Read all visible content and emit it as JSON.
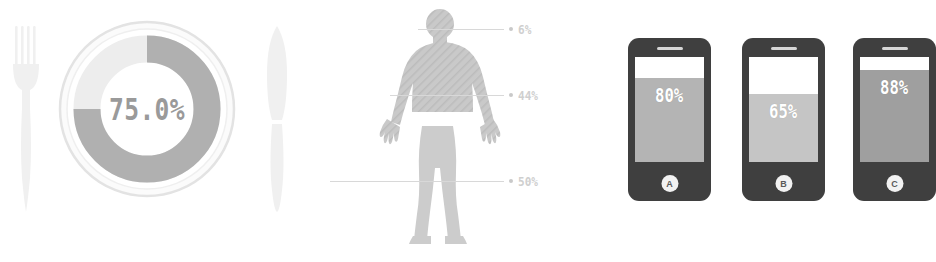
{
  "infographic": {
    "panels": [
      {
        "id": "plate-donut",
        "title": "Plate donut gauge"
      },
      {
        "id": "body-breakdown",
        "title": "Body distribution"
      },
      {
        "id": "phone-bars",
        "title": "Device fill levels"
      }
    ]
  },
  "donut": {
    "value_label": "75.0%",
    "track_color": "#ededed",
    "arc_color": "#b0b0b0",
    "plate_rim_color": "#e3e3e3",
    "text_color": "#9a9a9a",
    "fork_icon": "fork-icon",
    "knife_icon": "knife-icon"
  },
  "body": {
    "silhouette_color": "#cfcfcf",
    "silhouette_shade_color": "#bdbdbd",
    "callouts": [
      {
        "id": "head",
        "label": "6%"
      },
      {
        "id": "torso",
        "label": "44%"
      },
      {
        "id": "legs",
        "label": "50%"
      }
    ]
  },
  "phones": {
    "body_color": "#3f3f3f",
    "items": [
      {
        "id": "a",
        "percent_label": "80%",
        "fill_percent": 80,
        "fill_color": "#b4b4b4",
        "button_label": "A"
      },
      {
        "id": "b",
        "percent_label": "65%",
        "fill_percent": 65,
        "fill_color": "#c5c5c5",
        "button_label": "B"
      },
      {
        "id": "c",
        "percent_label": "88%",
        "fill_percent": 88,
        "fill_color": "#9f9f9f",
        "button_label": "C"
      }
    ]
  },
  "chart_data": [
    {
      "type": "pie",
      "title": "Plate donut gauge",
      "categories": [
        "Filled",
        "Remaining"
      ],
      "values": [
        75.0,
        25.0
      ],
      "unit": "%",
      "annotations": [
        "75.0%"
      ],
      "legend": "none",
      "notes": "Donut arc starts at 12 o'clock and sweeps 270 degrees clockwise"
    },
    {
      "type": "bar",
      "title": "Body distribution",
      "categories": [
        "Head",
        "Torso",
        "Legs"
      ],
      "values": [
        6,
        44,
        50
      ],
      "unit": "%",
      "xlabel": "",
      "ylabel": "",
      "ylim": [
        0,
        100
      ],
      "grid": false,
      "legend": "none",
      "annotations": [
        "6%",
        "44%",
        "50%"
      ]
    },
    {
      "type": "bar",
      "title": "Device fill levels",
      "categories": [
        "A",
        "B",
        "C"
      ],
      "values": [
        80,
        65,
        88
      ],
      "unit": "%",
      "xlabel": "",
      "ylabel": "",
      "ylim": [
        0,
        100
      ],
      "grid": false,
      "legend": "none",
      "annotations": [
        "80%",
        "65%",
        "88%"
      ]
    }
  ]
}
